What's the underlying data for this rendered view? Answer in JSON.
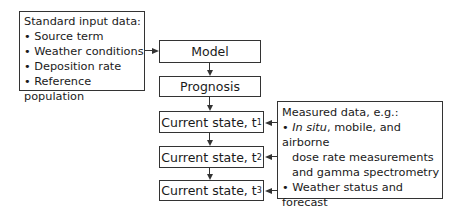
{
  "input_box": {
    "title": "Standard input data:",
    "items": [
      "Source term",
      "Weather conditions",
      "Deposition rate",
      "Reference population"
    ],
    "bullet": "•"
  },
  "flow": {
    "model": "Model",
    "prognosis": "Prognosis",
    "states": [
      {
        "label": "Current state, t",
        "sub": "1"
      },
      {
        "label": "Current state, t",
        "sub": "2"
      },
      {
        "label": "Current state, t",
        "sub": "3"
      }
    ]
  },
  "measured_box": {
    "title": "Measured data, e.g.:",
    "bullet": "•",
    "item1_italic": "In situ",
    "item1_rest": ", mobile, and airborne",
    "item1_line2": "dose rate measurements",
    "item1_line3": "and gamma spectrometry",
    "item2": "Weather status and forecast"
  }
}
